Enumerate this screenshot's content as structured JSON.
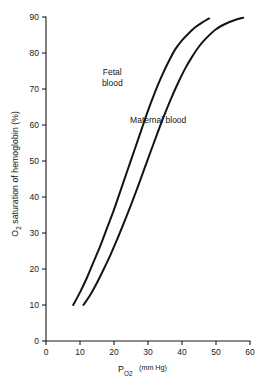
{
  "chart_data": {
    "type": "line",
    "title": "",
    "subtitle": "",
    "xlabel": "P_O2 (mm Hg)",
    "xlabel_main": "P",
    "xlabel_sub": "O",
    "xlabel_sub2": "2",
    "xlabel_unit": "(mm Hg)",
    "ylabel": "O2 saturation of hemoglobin (%)",
    "ylabel_pre": "O",
    "ylabel_sub": "2",
    "ylabel_post": " saturation of hemoglobin (%)",
    "xlim": [
      0,
      60
    ],
    "ylim": [
      0,
      90
    ],
    "xticks": [
      0,
      10,
      20,
      30,
      40,
      50,
      60
    ],
    "yticks": [
      0,
      10,
      20,
      30,
      40,
      50,
      60,
      70,
      80,
      90
    ],
    "xtick_labels": [
      "0",
      "10",
      "20",
      "30",
      "40",
      "50",
      "60"
    ],
    "ytick_labels": [
      "0",
      "10",
      "20",
      "30",
      "40",
      "50",
      "60",
      "70",
      "80",
      "90"
    ],
    "grid": false,
    "legend_position": "inline-annotations",
    "line_color": "#141414",
    "axis_color": "#1a1a1a",
    "background": "#ffffff",
    "series": [
      {
        "name": "Fetal blood",
        "label": "Fetal blood",
        "label_line1": "Fetal",
        "label_line2": "blood",
        "label_x": 19.5,
        "label_y": 74,
        "x": [
          8,
          10,
          12,
          14,
          16,
          18,
          20,
          22,
          24,
          26,
          28,
          30,
          32,
          34,
          36,
          38,
          40,
          42,
          44,
          46,
          48
        ],
        "y": [
          10,
          13.5,
          17.5,
          22,
          26.5,
          31.5,
          36.5,
          42,
          47.5,
          53,
          58.5,
          64,
          69,
          73.5,
          77.5,
          81,
          83.5,
          85.5,
          87.2,
          88.5,
          89.6
        ]
      },
      {
        "name": "Maternal blood",
        "label": "Maternal blood",
        "label_line1": "Maternal blood",
        "label_x": 33,
        "label_y": 60.5,
        "x": [
          11,
          13,
          15,
          17,
          19,
          21,
          23,
          25,
          27,
          29,
          31,
          33,
          35,
          37,
          39,
          41,
          43,
          45,
          47,
          50,
          53,
          56,
          58
        ],
        "y": [
          10,
          12.8,
          16.2,
          20,
          24,
          28.4,
          33,
          37.8,
          42.8,
          48,
          53.2,
          58.3,
          63.2,
          67.8,
          72,
          75.8,
          79,
          81.8,
          84,
          86.6,
          88.2,
          89.3,
          89.8
        ]
      }
    ],
    "annotations": [
      {
        "text": "Fetal blood",
        "x": 19.5,
        "y": 74
      },
      {
        "text": "Maternal blood",
        "x": 33,
        "y": 60.5
      }
    ]
  }
}
